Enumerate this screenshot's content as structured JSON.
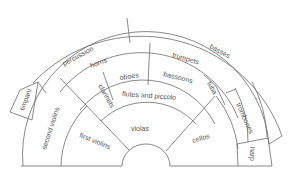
{
  "diagram": {
    "line_color": "#6b6b6b",
    "text_color": "#555555",
    "sections": {
      "percussion": "percussion",
      "basses": "basses",
      "timpani": "timpani",
      "horns": "horns",
      "trumpets": "trumpets",
      "oboes": "oboes",
      "bassoons": "bassoons",
      "clarinets": "clarinets",
      "flutes": "flutes and piccolo",
      "tuba": "tuba",
      "second_violins": "second violins",
      "first_violins": "first violins",
      "violas": "violas",
      "cellos": "cellos",
      "trombones": "trombones",
      "harp": "harp"
    }
  }
}
